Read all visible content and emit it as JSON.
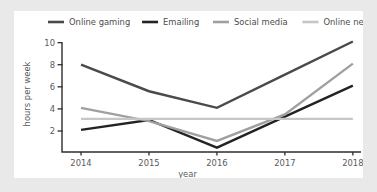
{
  "chart_data": {
    "type": "line",
    "title": "",
    "xlabel": "year",
    "ylabel": "hours per week",
    "categories": [
      "2014",
      "2015",
      "2016",
      "2017",
      "2018"
    ],
    "x": [
      2014,
      2015,
      2016,
      2017,
      2018
    ],
    "xlim": [
      2013.72,
      2018.12
    ],
    "ylim": [
      0.1,
      10.6
    ],
    "yticks": [
      2,
      4,
      6,
      8,
      10
    ],
    "ytick_labels": [
      "2",
      "4",
      "6",
      "8",
      "10"
    ],
    "xticks": [
      2014,
      2015,
      2016,
      2017,
      2018
    ],
    "xtick_labels": [
      "2014",
      "2015",
      "2016",
      "2017",
      "2018"
    ],
    "grid": false,
    "legend_position": "top",
    "series": [
      {
        "name": "Online gaming",
        "color": "#4a4a4a",
        "values": [
          8.0,
          5.6,
          4.1,
          7.1,
          10.1
        ]
      },
      {
        "name": "Emailing",
        "color": "#232323",
        "values": [
          2.1,
          3.0,
          0.5,
          3.3,
          6.1
        ]
      },
      {
        "name": "Social media",
        "color": "#a0a0a0",
        "values": [
          4.1,
          2.9,
          1.1,
          3.5,
          8.1
        ]
      },
      {
        "name": "Online newspapers",
        "color": "#c6c6c6",
        "values": [
          3.1,
          3.1,
          3.1,
          3.1,
          3.1
        ]
      }
    ]
  },
  "legend": {
    "items": [
      {
        "label": "Online gaming"
      },
      {
        "label": "Emailing"
      },
      {
        "label": "Social media"
      },
      {
        "label": "Online newspapers"
      }
    ]
  },
  "axes": {
    "y_title": "hours per week",
    "x_title": "year"
  },
  "colors": {
    "page_background": "#e9e9e9",
    "card_background": "#ffffff",
    "axis": "#2e2e2e",
    "tick_text": "#5a5a5a",
    "legend_text": "#4c4c4c"
  }
}
